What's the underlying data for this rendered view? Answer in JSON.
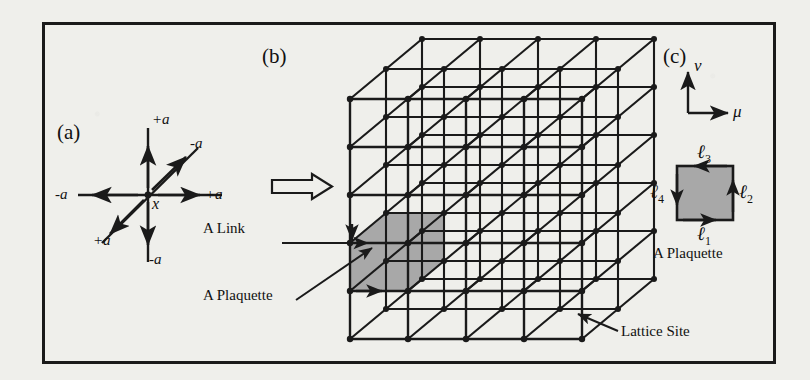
{
  "figure": {
    "panels": [
      {
        "id": "a",
        "label": "(a)"
      },
      {
        "id": "b",
        "label": "(b)"
      },
      {
        "id": "c",
        "label": "(c)"
      }
    ]
  },
  "panel_a": {
    "label": "(a)",
    "center_label": "x",
    "arrows": [
      {
        "name": "up",
        "label": "+a",
        "dir": "up"
      },
      {
        "name": "down",
        "label": "-a",
        "dir": "down"
      },
      {
        "name": "right",
        "label": "+a",
        "dir": "right"
      },
      {
        "name": "left",
        "label": "-a",
        "dir": "left"
      },
      {
        "name": "up-right",
        "label": "-a",
        "dir": "up-right"
      },
      {
        "name": "down-left",
        "label": "+a",
        "dir": "down-left"
      }
    ]
  },
  "transition": {
    "arrow_name": "block-arrow-right"
  },
  "panel_b": {
    "label": "(b)",
    "annotations": [
      {
        "name": "a-link",
        "text": "A Link"
      },
      {
        "name": "a-plaquette",
        "text": "A Plaquette"
      },
      {
        "name": "lattice-site",
        "text": "Lattice Site"
      }
    ],
    "lattice": {
      "cols": 4,
      "rows": 5,
      "depth": 2,
      "cell_w": 58,
      "cell_h": 48,
      "depth_dx": 36,
      "depth_dy": -30,
      "origin_x": 350,
      "origin_y": 339,
      "shade_color": "#a8a8a8",
      "line_color": "#1a1a1a"
    }
  },
  "panel_c": {
    "label": "(c)",
    "axes": [
      {
        "name": "mu-axis",
        "label": "μ"
      },
      {
        "name": "nu-axis",
        "label": "ν"
      }
    ],
    "links": [
      {
        "name": "link-1",
        "label": "ℓ",
        "sub": "1"
      },
      {
        "name": "link-2",
        "label": "ℓ",
        "sub": "2"
      },
      {
        "name": "link-3",
        "label": "ℓ",
        "sub": "3"
      },
      {
        "name": "link-4",
        "label": "ℓ",
        "sub": "4"
      }
    ],
    "caption": "A Plaquette",
    "shade_color": "#a8a8a8"
  },
  "colors": {
    "background": "#efefeb",
    "ink": "#1a1a1a",
    "shade": "#a8a8a8"
  }
}
